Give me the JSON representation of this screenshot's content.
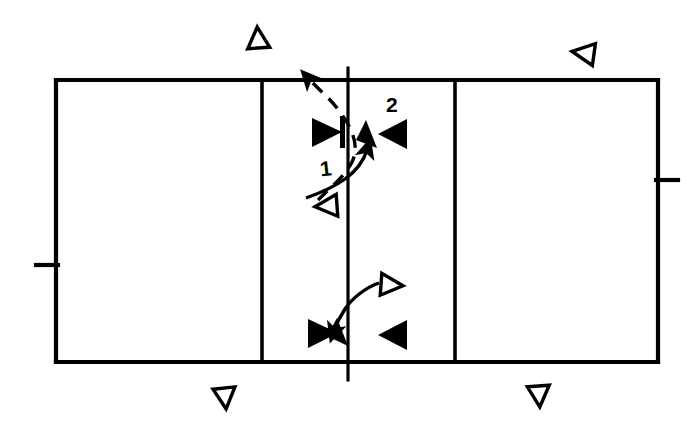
{
  "diagram": {
    "background_color": "#ffffff",
    "line_color": "#000000",
    "width": 694,
    "height": 433,
    "labels": [
      {
        "id": "label-1",
        "text": "1",
        "x": 320,
        "y": 158
      },
      {
        "id": "label-2",
        "text": "2",
        "x": 386,
        "y": 94
      }
    ],
    "court": {
      "name": "court-outline",
      "left": 56,
      "right": 658,
      "top": 80,
      "bottom": 362,
      "vertical_lines_x": [
        262,
        348,
        455
      ],
      "net_line_x": 348,
      "net_extends_above": 68,
      "net_extends_below": 380,
      "side_ticks": [
        {
          "name": "left-side-tick",
          "x_from": 36,
          "x_to": 58,
          "y": 265
        },
        {
          "name": "right-side-tick",
          "x_from": 656,
          "x_to": 678,
          "y": 180
        }
      ]
    },
    "markers": {
      "hollow_triangles": [
        {
          "name": "hollow-triangle-up-top-left",
          "cx": 258,
          "cy": 38,
          "size": 22,
          "direction": "up"
        },
        {
          "name": "hollow-triangle-left-top-right",
          "cx": 583,
          "cy": 53,
          "size": 22,
          "direction": "left"
        },
        {
          "name": "hollow-triangle-left-mid",
          "cx": 326,
          "cy": 205,
          "size": 22,
          "direction": "left"
        },
        {
          "name": "hollow-triangle-right-lower",
          "cx": 392,
          "cy": 285,
          "size": 22,
          "direction": "right"
        },
        {
          "name": "hollow-triangle-down-bottom-left",
          "cx": 225,
          "cy": 398,
          "size": 22,
          "direction": "down"
        },
        {
          "name": "hollow-triangle-down-bottom-right",
          "cx": 539,
          "cy": 396,
          "size": 22,
          "direction": "down"
        }
      ],
      "filled_triangles": [
        {
          "name": "filled-triangle-right-upper-left",
          "cx": 326,
          "cy": 132,
          "size": 24,
          "direction": "right",
          "has_bar": true
        },
        {
          "name": "filled-triangle-left-upper-right",
          "cx": 392,
          "cy": 134,
          "size": 24,
          "direction": "left",
          "has_bar": false
        },
        {
          "name": "filled-triangle-right-lower-left",
          "cx": 324,
          "cy": 333,
          "size": 24,
          "direction": "right",
          "has_bar": false
        },
        {
          "name": "filled-triangle-left-lower-right",
          "cx": 392,
          "cy": 335,
          "size": 24,
          "direction": "left",
          "has_bar": false
        }
      ],
      "movement_arrows": [
        {
          "name": "movement-arrow-1",
          "description": "dashed curve from lower hollow triangle up across net, arrowhead at top",
          "path": "M 318 200 C 330 188, 345 176, 352 162 C 360 146, 352 128, 340 112 C 330 98, 318 88, 308 76",
          "style": "dashed",
          "arrow_at": "end"
        },
        {
          "name": "movement-arrow-2",
          "description": "solid curve from lower-left across net toward label 2 marker, arrowhead at top",
          "path": "M 306 198 C 320 192, 334 186, 345 178 C 356 170, 364 160, 368 148",
          "style": "solid",
          "arrow_at": "end"
        },
        {
          "name": "movement-arrow-3",
          "description": "short solid curve from lower hollow triangle to lower filled marker",
          "path": "M 378 283 C 366 286, 352 296, 344 308 C 338 317, 334 324, 332 330",
          "style": "solid",
          "arrow_at": "end"
        }
      ]
    }
  }
}
